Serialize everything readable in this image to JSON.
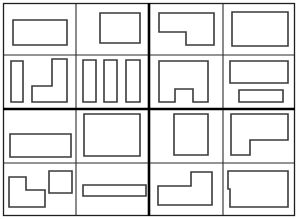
{
  "figure": {
    "width": 298,
    "height": 219,
    "background_color": "#ffffff",
    "outline_color": "#3a3a3a",
    "major_divider_color": "#000000",
    "minor_divider_color": "#2b2b2b",
    "outer_frame": {
      "x": 3,
      "y": 3,
      "width": 292,
      "height": 213
    },
    "major_dividers": [
      {
        "name": "vertical-center-divider",
        "x1": 149,
        "y1": 3,
        "x2": 149,
        "y2": 216
      },
      {
        "name": "horizontal-center-divider",
        "x1": 3,
        "y1": 109,
        "x2": 295,
        "y2": 109
      }
    ],
    "minor_dividers": [
      {
        "name": "panel-1-horizontal-split",
        "x1": 3,
        "y1": 55,
        "x2": 149,
        "y2": 55
      },
      {
        "name": "panel-1-vertical-split",
        "x1": 76,
        "y1": 3,
        "x2": 76,
        "y2": 109
      },
      {
        "name": "panel-2-horizontal-split",
        "x1": 149,
        "y1": 55,
        "x2": 295,
        "y2": 55
      },
      {
        "name": "panel-2-vertical-split",
        "x1": 223,
        "y1": 3,
        "x2": 223,
        "y2": 109
      },
      {
        "name": "panel-3-horizontal-split",
        "x1": 3,
        "y1": 163,
        "x2": 149,
        "y2": 163
      },
      {
        "name": "panel-3-vertical-split",
        "x1": 76,
        "y1": 109,
        "x2": 76,
        "y2": 216
      },
      {
        "name": "panel-4-horizontal-split",
        "x1": 149,
        "y1": 163,
        "x2": 295,
        "y2": 163
      },
      {
        "name": "panel-4-vertical-split",
        "x1": 223,
        "y1": 109,
        "x2": 223,
        "y2": 216
      }
    ],
    "panels": [
      {
        "id": "panel-top-left",
        "cells": [
          {
            "id": "cell-1-1",
            "shapes": [
              {
                "name": "wide-rectangle",
                "type": "rectangle",
                "points": "13,20 67,20 67,45 13,45"
              }
            ]
          },
          {
            "id": "cell-1-2",
            "shapes": [
              {
                "name": "square",
                "type": "rectangle",
                "points": "100,13 140,13 140,43 100,43"
              }
            ]
          },
          {
            "id": "cell-1-3",
            "shapes": [
              {
                "name": "tall-narrow-rectangle",
                "type": "rectangle",
                "points": "11,61 23,61 23,102 11,102"
              },
              {
                "name": "l-shape-foot-left",
                "type": "polygon",
                "points": "52,59 67,59 67,102 32,102 32,86 52,86"
              }
            ]
          },
          {
            "id": "cell-1-4",
            "shapes": [
              {
                "name": "narrow-rectangle-left",
                "type": "rectangle",
                "points": "83,60 96,60 96,102 83,102"
              },
              {
                "name": "narrow-rectangle-middle",
                "type": "rectangle",
                "points": "104,60 117,60 117,102 104,102"
              },
              {
                "name": "narrow-rectangle-right",
                "type": "rectangle",
                "points": "126,60 140,60 140,102 126,102"
              }
            ]
          }
        ]
      },
      {
        "id": "panel-top-right",
        "cells": [
          {
            "id": "cell-2-1",
            "shapes": [
              {
                "name": "l-shape-notch-bottom-left",
                "type": "polygon",
                "points": "159,13 214,13 214,45 186,45 186,32 159,32"
              }
            ]
          },
          {
            "id": "cell-2-2",
            "shapes": [
              {
                "name": "large-rectangle",
                "type": "rectangle",
                "points": "232,12 288,12 288,46 232,46"
              }
            ]
          },
          {
            "id": "cell-2-3",
            "shapes": [
              {
                "name": "u-shape-arch",
                "type": "polygon",
                "points": "159,61 208,61 208,102 193,102 193,89 175,89 175,102 159,102"
              }
            ]
          },
          {
            "id": "cell-2-4",
            "shapes": [
              {
                "name": "wide-rectangle-upper",
                "type": "rectangle",
                "points": "230,61 288,61 288,83 230,83"
              },
              {
                "name": "wide-rectangle-lower",
                "type": "rectangle",
                "points": "239,90 283,90 283,102 239,102"
              }
            ]
          }
        ]
      },
      {
        "id": "panel-bottom-left",
        "cells": [
          {
            "id": "cell-3-1",
            "shapes": [
              {
                "name": "wide-rectangle",
                "type": "rectangle",
                "points": "10,134 71,134 71,157 10,157"
              }
            ]
          },
          {
            "id": "cell-3-2",
            "shapes": [
              {
                "name": "large-rectangle",
                "type": "rectangle",
                "points": "84,114 140,114 140,156 84,156"
              }
            ]
          },
          {
            "id": "cell-3-3",
            "shapes": [
              {
                "name": "l-shape-step-down-right",
                "type": "polygon",
                "points": "9,177 26,177 26,190 45,190 45,207 9,207"
              },
              {
                "name": "small-square",
                "type": "rectangle",
                "points": "49,171 72,171 72,193 49,193"
              }
            ]
          },
          {
            "id": "cell-3-4",
            "shapes": [
              {
                "name": "long-thin-rectangle",
                "type": "rectangle",
                "points": "83,185 146,185 146,196 83,196"
              }
            ]
          }
        ]
      },
      {
        "id": "panel-bottom-right",
        "cells": [
          {
            "id": "cell-4-1",
            "shapes": [
              {
                "name": "tall-rectangle",
                "type": "rectangle",
                "points": "174,114 208,114 208,155 174,155"
              }
            ]
          },
          {
            "id": "cell-4-2",
            "shapes": [
              {
                "name": "l-shape-notch-bottom-left",
                "type": "polygon",
                "points": "231,114 288,114 288,140 250,140 250,155 231,155"
              }
            ]
          },
          {
            "id": "cell-4-3",
            "shapes": [
              {
                "name": "l-shape-step-up-right",
                "type": "polygon",
                "points": "191,172 212,172 212,205 158,205 158,186 191,186"
              }
            ]
          },
          {
            "id": "cell-4-4",
            "shapes": [
              {
                "name": "rectangle-with-left-notch",
                "type": "polygon",
                "points": "228,171 288,171 288,207 230,207 230,189 228,189 228,182"
              }
            ]
          }
        ]
      }
    ]
  }
}
